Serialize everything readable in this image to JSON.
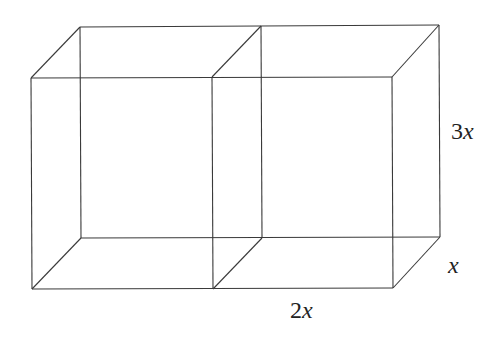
{
  "figure": {
    "stroke_color": "#3a3a3a",
    "background": "#ffffff",
    "vertices": {
      "front_top_left": [
        31,
        78
      ],
      "front_top_mid": [
        212,
        77
      ],
      "front_top_right": [
        392,
        77
      ],
      "front_bottom_left": [
        32,
        289
      ],
      "front_bottom_mid": [
        213,
        289
      ],
      "front_bottom_right": [
        393,
        288
      ],
      "back_top_left": [
        80,
        27
      ],
      "back_top_mid": [
        261,
        26
      ],
      "back_top_right": [
        439,
        25
      ],
      "back_bottom_left": [
        81,
        238
      ],
      "back_bottom_mid": [
        262,
        238
      ],
      "back_bottom_right": [
        440,
        237
      ]
    }
  },
  "labels": {
    "height": {
      "coef": "3",
      "var": "x"
    },
    "depth": {
      "coef": "",
      "var": "x"
    },
    "width": {
      "coef": "2",
      "var": "x"
    }
  }
}
